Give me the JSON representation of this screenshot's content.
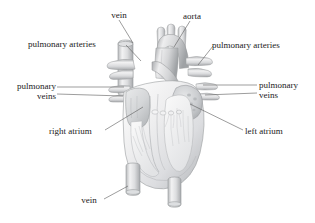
{
  "figure": {
    "background_color": "#ffffff",
    "line_color": "#5a5a5a",
    "text_color": "#1a1a1a",
    "illustration_style": "grayscale pencil-shaded cutaway",
    "width": 315,
    "height": 223
  },
  "labels": {
    "vein_top": "vein",
    "aorta": "aorta",
    "pulmonary_arteries_left": "pulmonary arteries",
    "pulmonary_arteries_right": "pulmonary arteries",
    "pulmonary_veins_left_line1": "pulmonary",
    "pulmonary_veins_left_line2": "veins",
    "pulmonary_veins_right_line1": "pulmonary",
    "pulmonary_veins_right_line2": "veins",
    "right_atrium": "right atrium",
    "left_atrium": "left atrium",
    "vein_bottom": "vein"
  },
  "structures": {
    "superior_vena_cava": "superior-vena-cava",
    "aortic_arch": "aortic-arch",
    "pulmonary_trunk": "pulmonary-trunk",
    "right_atrium_chamber": "right-atrium",
    "left_atrium_chamber": "left-atrium",
    "right_ventricle_chamber": "right-ventricle",
    "left_ventricle_chamber": "left-ventricle",
    "inferior_vena_cava": "inferior-vena-cava",
    "descending_aorta": "descending-aorta"
  },
  "colors": {
    "vessel_light": "#ececed",
    "vessel_mid": "#d2d3d4",
    "vessel_dark": "#a9abad",
    "vessel_shadow": "#8d9093",
    "outline": "#9a9c9e",
    "chamber_fill": "#e4e5e6"
  }
}
